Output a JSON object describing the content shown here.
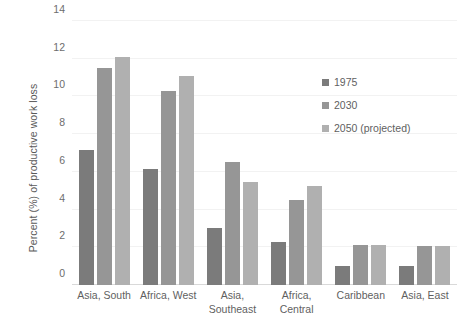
{
  "chart_data": {
    "type": "bar",
    "title": "",
    "xlabel": "",
    "ylabel": "Percent (%) of productive work loss",
    "ylim": [
      0,
      14
    ],
    "yticks": [
      0,
      2,
      4,
      6,
      8,
      10,
      12,
      14
    ],
    "ytick_labels": [
      "0",
      "2",
      "4",
      "6",
      "8",
      "10",
      "12",
      "14"
    ],
    "grid": true,
    "legend_position": "right",
    "categories": [
      "Asia, South",
      "Africa, West",
      "Asia,\nSoutheast",
      "Africa,\nCentral",
      "Caribbean",
      "Asia, East"
    ],
    "series": [
      {
        "name": "1975",
        "color": "#7b7b7b",
        "values": [
          7.15,
          6.15,
          3.0,
          2.3,
          1.0,
          1.0
        ]
      },
      {
        "name": "2030",
        "color": "#969696",
        "values": [
          11.5,
          10.3,
          6.55,
          4.5,
          2.1,
          2.05
        ]
      },
      {
        "name": "2050 (projected)",
        "color": "#b0b0b0",
        "values": [
          12.1,
          11.1,
          5.45,
          5.25,
          2.1,
          2.05
        ]
      }
    ]
  },
  "colors": {
    "series_1975": "#7b7b7b",
    "series_2030": "#969696",
    "series_2050": "#b0b0b0",
    "axis_text": "#5f5f5f",
    "gridline": "#f2f2f2",
    "background": "#ffffff"
  }
}
